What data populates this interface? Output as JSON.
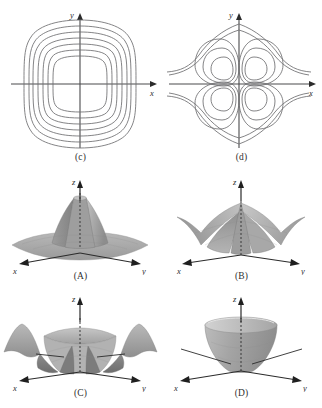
{
  "figure": {
    "background_color": "#ffffff",
    "ink_color": "#58585a",
    "axis_color": "#4a4a4c",
    "caption_color": "#2f2f2f",
    "surface_light": "#cfcfcf",
    "surface_mid": "#a9a9a9",
    "surface_dark": "#7e7e7e",
    "surface_darkest": "#6a6a6a"
  },
  "panels": [
    {
      "id": "c",
      "caption": "(c)",
      "kind": "contour-plot",
      "axis_labels": {
        "x": "x",
        "y": "y"
      },
      "description": "Nested rounded-square (superellipse) level curves centered at the origin",
      "contour_count": 7
    },
    {
      "id": "d",
      "caption": "(d)",
      "kind": "contour-plot",
      "axis_labels": {
        "x": "x",
        "y": "y"
      },
      "description": "Four-petal level curves, one closed loop in each quadrant with open outer branches",
      "contour_count": 12
    },
    {
      "id": "A",
      "caption": "(A)",
      "kind": "surface-plot",
      "axis_labels": {
        "x": "x",
        "y": "y",
        "z": "z"
      },
      "description": "Flat plateau rising to a single central peak"
    },
    {
      "id": "B",
      "caption": "(B)",
      "kind": "surface-plot",
      "axis_labels": {
        "x": "x",
        "y": "y",
        "z": "z"
      },
      "description": "Four downward lobes with a narrow central spike"
    },
    {
      "id": "C",
      "caption": "(C)",
      "kind": "surface-plot",
      "axis_labels": {
        "x": "x",
        "y": "y",
        "z": "z"
      },
      "description": "Rippled surface with a raised central plateau and four outer waves"
    },
    {
      "id": "D",
      "caption": "(D)",
      "kind": "surface-plot",
      "axis_labels": {
        "x": "x",
        "y": "y",
        "z": "z"
      },
      "description": "Upward-opening bowl (paraboloid)"
    }
  ]
}
